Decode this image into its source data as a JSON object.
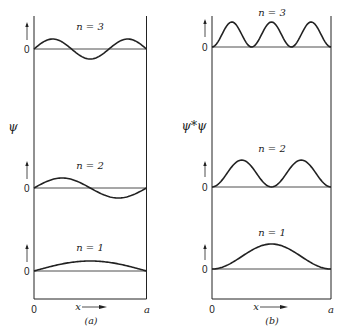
{
  "figure": {
    "panels": [
      {
        "id": "a",
        "caption": "(a)",
        "y_axis_label": "ψ",
        "x_axis": {
          "start_label": "0",
          "variable_label": "x",
          "end_label": "a"
        },
        "curves": [
          {
            "n_label": "n = 3",
            "zero_label": "0",
            "function": "sin(3πx/a)"
          },
          {
            "n_label": "n = 2",
            "zero_label": "0",
            "function": "sin(2πx/a)"
          },
          {
            "n_label": "n = 1",
            "zero_label": "0",
            "function": "sin(πx/a)"
          }
        ]
      },
      {
        "id": "b",
        "caption": "(b)",
        "y_axis_label": "ψ*ψ",
        "x_axis": {
          "start_label": "0",
          "variable_label": "x",
          "end_label": "a"
        },
        "curves": [
          {
            "n_label": "n = 3",
            "zero_label": "0",
            "function": "sin²(3πx/a)"
          },
          {
            "n_label": "n = 2",
            "zero_label": "0",
            "function": "sin²(2πx/a)"
          },
          {
            "n_label": "n = 1",
            "zero_label": "0",
            "function": "sin²(πx/a)"
          }
        ]
      }
    ]
  }
}
